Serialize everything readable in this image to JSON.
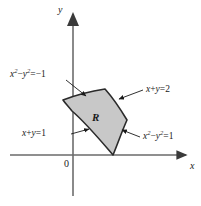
{
  "figure": {
    "type": "math-diagram",
    "background_color": "#ffffff",
    "region_fill_color": "#c8c8c8",
    "stroke_color": "#1a1a1a"
  },
  "axes": {
    "x_label": "x",
    "y_label": "y",
    "origin_label": "0"
  },
  "region": {
    "label": "R"
  },
  "boundary_labels": {
    "upper_left": {
      "var1": "x",
      "exp1": "2",
      "minus": "−",
      "var2": "y",
      "exp2": "2",
      "equals": "=",
      "value": "−1",
      "full": "x² − y² = −1"
    },
    "upper_right": {
      "full": "x + y = 2",
      "var1": "x",
      "plus": "+",
      "var2": "y",
      "equals": "=",
      "value": "2"
    },
    "lower_left": {
      "full": "x + y = 1",
      "var1": "x",
      "plus": "+",
      "var2": "y",
      "equals": "=",
      "value": "1"
    },
    "lower_right": {
      "var1": "x",
      "exp1": "2",
      "minus": "−",
      "var2": "y",
      "exp2": "2",
      "equals": "=",
      "value": "1",
      "full": "x² − y² = 1"
    }
  }
}
